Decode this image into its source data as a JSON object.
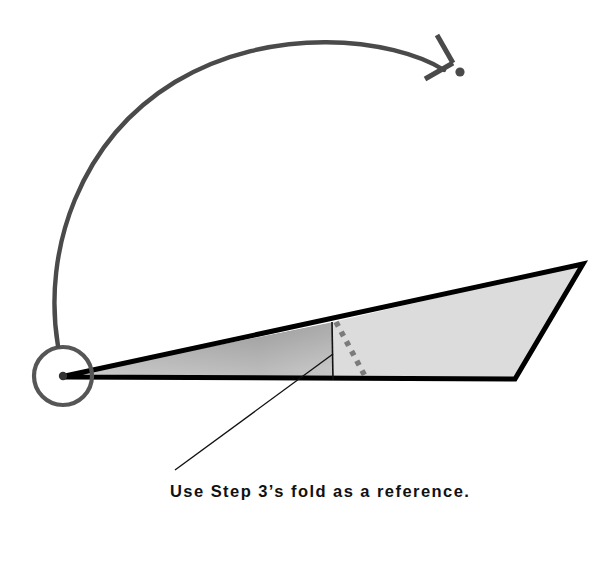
{
  "diagram": {
    "kind": "origami-fold-step",
    "caption": {
      "text": "Use Step 3’s fold as a reference.",
      "x": 170,
      "y": 497,
      "color": "#111111"
    },
    "colors": {
      "background": "#ffffff",
      "paper_front": "#dcdcdc",
      "paper_shadow_dark": "#8f8f8f",
      "paper_shadow_light": "#d2d2d2",
      "outline": "#000000",
      "arrow": "#4a4a4a",
      "crease_dash": "#7b7b7b",
      "leader": "#111111",
      "pivot_ring": "#565656"
    },
    "shape": {
      "name": "folded-paper-outline",
      "outline_points": "65,376 583,264 515,379 65,377",
      "outline_width": 5,
      "front_panel_points": "333,322 583,264 515,379 333,380",
      "shaded_sliver_points": "65,376 333,322 333,380"
    },
    "crease": {
      "name": "step-3-reference-crease",
      "solid_line": {
        "x1": 332,
        "y1": 322,
        "x2": 333,
        "y2": 380,
        "width": 1.6
      },
      "dashed_line": {
        "x1": 336,
        "y1": 322,
        "x2": 366,
        "y2": 378,
        "width": 5.5,
        "dash": "5 6"
      }
    },
    "leader": {
      "name": "caption-leader-line",
      "x1": 175,
      "y1": 470,
      "x2": 333,
      "y2": 354,
      "width": 1.4
    },
    "pivot": {
      "name": "rotation-pivot",
      "cx": 63,
      "cy": 376,
      "ring_radius": 29,
      "ring_width": 4.2,
      "dot_radius": 4.2
    },
    "arrow": {
      "name": "fold-rotation-arrow",
      "path": "M 58,346 C 42,250 80,140 175,82 C 272,24 392,38 444,70",
      "width": 4.4,
      "head": {
        "stroke_a": {
          "x1": 437,
          "y1": 35,
          "x2": 453,
          "y2": 63
        },
        "stroke_b": {
          "x1": 453,
          "y1": 63,
          "x2": 425,
          "y2": 79
        },
        "width": 5
      },
      "target_dot": {
        "cx": 460,
        "cy": 72,
        "r": 4.6
      }
    }
  }
}
